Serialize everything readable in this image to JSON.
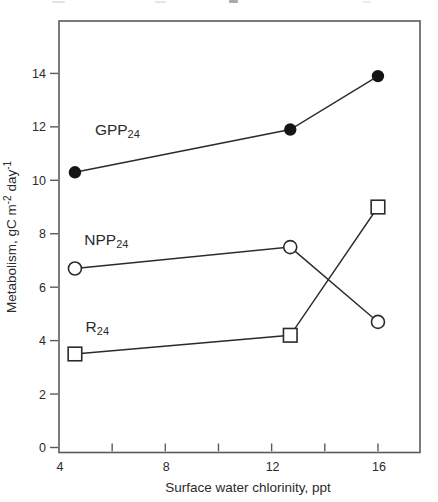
{
  "page": {
    "background": "#ffffff"
  },
  "chart_data": {
    "type": "line",
    "title": "",
    "xlabel": "Surface water chlorinity, ppt",
    "ylabel": "Metabolism, gC m-2 day-1",
    "ylabel_parts": [
      {
        "t": "Metabolism, gC m"
      },
      {
        "t": "-2",
        "sup": true
      },
      {
        "t": " day"
      },
      {
        "t": "-1",
        "sup": true
      }
    ],
    "xlim": [
      4,
      17.6
    ],
    "ylim": [
      0,
      16
    ],
    "grid": false,
    "legend": "inline-labels",
    "x_ticks": [
      {
        "v": 4,
        "label": "4"
      },
      {
        "v": 6,
        "label": ""
      },
      {
        "v": 8,
        "label": "8"
      },
      {
        "v": 10,
        "label": ""
      },
      {
        "v": 12,
        "label": "12"
      },
      {
        "v": 14,
        "label": ""
      },
      {
        "v": 16,
        "label": "16"
      }
    ],
    "y_ticks": [
      {
        "v": 0,
        "label": "0"
      },
      {
        "v": 2,
        "label": "2"
      },
      {
        "v": 4,
        "label": "4"
      },
      {
        "v": 6,
        "label": "6"
      },
      {
        "v": 8,
        "label": "8"
      },
      {
        "v": 10,
        "label": "10"
      },
      {
        "v": 12,
        "label": "12"
      },
      {
        "v": 14,
        "label": "14"
      }
    ],
    "x": [
      4.6,
      12.7,
      16.0
    ],
    "series": [
      {
        "name": "GPP24",
        "label_parts": [
          {
            "t": "GPP"
          },
          {
            "t": "24",
            "sub": true
          }
        ],
        "marker": "filled-circle",
        "values": [
          10.3,
          11.9,
          13.9
        ],
        "label_pos": {
          "x": 5.35,
          "y": 11.7
        }
      },
      {
        "name": "NPP24",
        "label_parts": [
          {
            "t": "NPP"
          },
          {
            "t": "24",
            "sub": true
          }
        ],
        "marker": "open-circle",
        "values": [
          6.7,
          7.5,
          4.7
        ],
        "label_pos": {
          "x": 4.95,
          "y": 7.58
        }
      },
      {
        "name": "R24",
        "label_parts": [
          {
            "t": "R"
          },
          {
            "t": "24",
            "sub": true
          }
        ],
        "marker": "open-square",
        "values": [
          3.5,
          4.2,
          9.0
        ],
        "label_pos": {
          "x": 5.0,
          "y": 4.33
        }
      }
    ],
    "colors": {
      "line": "#2b2b2b",
      "marker_fill": "#151515",
      "marker_open_fill": "#ffffff",
      "frame": "#5a5a5a",
      "text": "#2b2b2b"
    }
  }
}
